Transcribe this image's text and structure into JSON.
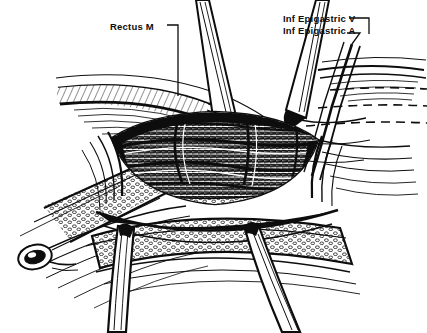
{
  "figure": {
    "kind": "anatomical-line-drawing",
    "style": "black-and-white pen-and-ink hatching",
    "background_color": "#ffffff",
    "ink_color": "#0d0d0d",
    "width": 427,
    "height": 333
  },
  "labels": [
    {
      "id": "rectus",
      "text": "Rectus M",
      "x": 110,
      "y": 21,
      "leader": {
        "from_x": 167,
        "from_y": 25,
        "elbow_x": 178,
        "elbow_y": 25,
        "to_x": 178,
        "to_y": 96
      }
    },
    {
      "id": "epigastric-vein",
      "text": "Inf  Epigastric V",
      "x": 283,
      "y": 13,
      "leader": {
        "from_x": 349,
        "from_y": 18,
        "elbow_x": 369,
        "elbow_y": 18,
        "to_x": 369,
        "to_y": 34
      }
    },
    {
      "id": "epigastric-artery",
      "text": "Inf  Epigastric A",
      "x": 283,
      "y": 25,
      "leader": {
        "from_x": 347,
        "from_y": 33,
        "elbow_x": 360,
        "elbow_y": 33,
        "to_x": 352,
        "to_y": 44
      }
    }
  ],
  "structures": {
    "retractors": [
      {
        "name": "upper-left-retractor-blade",
        "description": "narrow blade descending from top center-left"
      },
      {
        "name": "upper-right-retractor-blade",
        "description": "narrow blade descending from top center-right"
      },
      {
        "name": "lower-left-retractor-blade",
        "description": "blade rising from bottom center-left"
      },
      {
        "name": "lower-right-retractor-blade",
        "description": "blade rising from bottom center-right"
      }
    ],
    "tissue_layers": [
      {
        "name": "reflected-fascial-flap-left",
        "description": "layered fascia retracted to the upper left"
      },
      {
        "name": "subcutaneous-fat-lower",
        "description": "stippled fatty tissue band across the lower field"
      },
      {
        "name": "subcutaneous-fat-left",
        "description": "stippled fatty tissue band on the left margin"
      },
      {
        "name": "muscle-bed-center",
        "description": "densely hatched muscle floor of the wound"
      }
    ],
    "vessels": [
      {
        "name": "inferior-epigastric-vein",
        "description": "paired vessel crossing the wound obliquely"
      },
      {
        "name": "inferior-epigastric-artery",
        "description": "companion vessel beneath the vein"
      },
      {
        "name": "perforating-branches",
        "description": "small branches arching across the muscle bed"
      },
      {
        "name": "cut-vessel-stump",
        "description": "small oval cut-end at lower left"
      }
    ],
    "dashed_lines": [
      {
        "name": "vessel-course-dashed-upper",
        "y": 89
      },
      {
        "name": "vessel-course-dashed-middle",
        "y": 106
      },
      {
        "name": "vessel-course-dashed-lower",
        "y": 123
      }
    ]
  }
}
